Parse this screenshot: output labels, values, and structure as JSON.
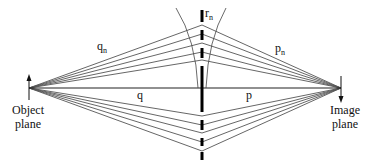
{
  "diagram": {
    "colors": {
      "ray": "#555555",
      "axis": "#222222",
      "plate": "#000000",
      "wavefront": "#444444",
      "text": "#111111"
    },
    "labels": {
      "q_n": {
        "base": "q",
        "sub": "n"
      },
      "p_n": {
        "base": "p",
        "sub": "n"
      },
      "r_n": {
        "base": "r",
        "sub": "n"
      },
      "q": "q",
      "p": "p",
      "object_plane_line1": "Object",
      "object_plane_line2": "plane",
      "image_plane_line1": "Image",
      "image_plane_line2": "plane"
    },
    "geometry": {
      "object_point": [
        29,
        88
      ],
      "image_point": [
        341,
        88
      ],
      "plate_x": 202,
      "top_ray_heights": [
        25,
        34,
        43,
        52,
        60
      ],
      "bottom_ray_heights": [
        116,
        125,
        133,
        142,
        151
      ],
      "plate_segments": [
        [
          10,
          22
        ],
        [
          30,
          40
        ],
        [
          48,
          58
        ],
        [
          66,
          112
        ],
        [
          120,
          130
        ],
        [
          138,
          146
        ],
        [
          152,
          160
        ]
      ]
    }
  }
}
